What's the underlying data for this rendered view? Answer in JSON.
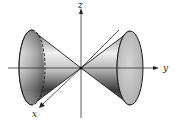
{
  "figure": {
    "axes": {
      "x_label": "x",
      "y_label": "y",
      "z_label": "z"
    },
    "surface": {
      "type": "double cone",
      "axis_of_symmetry": "y",
      "vertex": "origin",
      "hidden_rim_style": "dashed"
    },
    "colors": {
      "outline": "#1a1a1a",
      "shade_dark": "#3a3a3a",
      "shade_light": "#f4f4f4",
      "base_face": "#c8c8c8"
    }
  }
}
